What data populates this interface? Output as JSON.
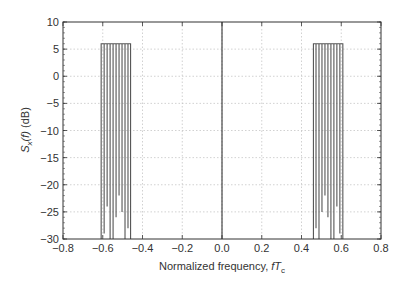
{
  "chart_data": {
    "type": "line",
    "title": "",
    "xlabel": "Normalized frequency, fT_c",
    "xlabel_parts": {
      "prefix": "Normalized frequency, ",
      "italic": "fT",
      "subscript": "c"
    },
    "ylabel": "S_x(f) (dB)",
    "ylabel_parts": {
      "italic": "S",
      "subscript": "x",
      "mid": "(f)",
      "suffix": " (dB)"
    },
    "xlim": [
      -0.8,
      0.8
    ],
    "ylim": [
      -30,
      10
    ],
    "xticks": [
      -0.8,
      -0.6,
      -0.4,
      -0.2,
      0.0,
      0.2,
      0.4,
      0.6,
      0.8
    ],
    "xtick_labels": [
      "−0.8",
      "−0.6",
      "−0.4",
      "−0.2",
      "0.0",
      "0.2",
      "0.4",
      "0.6",
      "0.8"
    ],
    "yticks": [
      10,
      5,
      0,
      -5,
      -10,
      -15,
      -20,
      -25,
      -30
    ],
    "ytick_labels": [
      "10",
      "5",
      "0",
      "−5",
      "−10",
      "−15",
      "−20",
      "−25",
      "−30"
    ],
    "grid": true,
    "legend": null,
    "series": [
      {
        "name": "left band",
        "plateau_db": 6,
        "x_range": [
          -0.61,
          -0.46
        ],
        "dips": [
          {
            "x": -0.608,
            "y": -30
          },
          {
            "x": -0.593,
            "y": -29
          },
          {
            "x": -0.578,
            "y": -24
          },
          {
            "x": -0.563,
            "y": -30
          },
          {
            "x": -0.548,
            "y": -30
          },
          {
            "x": -0.533,
            "y": -26
          },
          {
            "x": -0.518,
            "y": -22
          },
          {
            "x": -0.503,
            "y": -25
          },
          {
            "x": -0.488,
            "y": -30
          },
          {
            "x": -0.473,
            "y": -28
          },
          {
            "x": -0.46,
            "y": -30
          }
        ]
      },
      {
        "name": "right band",
        "plateau_db": 6,
        "x_range": [
          0.46,
          0.61
        ],
        "dips": [
          {
            "x": 0.46,
            "y": -30
          },
          {
            "x": 0.473,
            "y": -28
          },
          {
            "x": 0.488,
            "y": -30
          },
          {
            "x": 0.503,
            "y": -25
          },
          {
            "x": 0.518,
            "y": -22
          },
          {
            "x": 0.533,
            "y": -26
          },
          {
            "x": 0.548,
            "y": -30
          },
          {
            "x": 0.563,
            "y": -30
          },
          {
            "x": 0.578,
            "y": -24
          },
          {
            "x": 0.593,
            "y": -29
          },
          {
            "x": 0.608,
            "y": -30
          }
        ]
      },
      {
        "name": "center line",
        "x": [
          0.0,
          0.0
        ],
        "y": [
          -30,
          10
        ]
      }
    ]
  },
  "colors": {
    "line": "#555555",
    "grid": "#bdbdbd",
    "axis": "#333333",
    "background": "#ffffff"
  }
}
